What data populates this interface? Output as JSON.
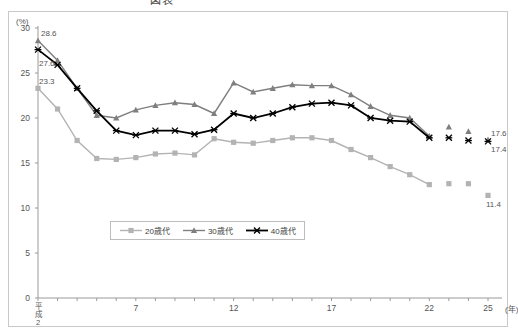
{
  "title": {
    "text": "図表",
    "visible": "partially-cropped"
  },
  "axis": {
    "y_unit": "(%)",
    "x_unit": "(年)",
    "x_era_label": "平成",
    "x_era_value": "2"
  },
  "legend": {
    "items": [
      {
        "label": "20歳代",
        "color": "#b3b3b3",
        "marker": "square"
      },
      {
        "label": "30歳代",
        "color": "#7f7f7f",
        "marker": "triangle"
      },
      {
        "label": "40歳代",
        "color": "#000000",
        "marker": "cross"
      }
    ]
  },
  "annotations": {
    "start": [
      "28.6",
      "27.6",
      "23.3"
    ],
    "end": [
      "17.6",
      "17.4",
      "11.4"
    ]
  },
  "chart_data": {
    "type": "line",
    "xlabel": "(年)",
    "ylabel": "(%)",
    "ylim": [
      0,
      30
    ],
    "yticks": [
      0,
      5,
      10,
      15,
      20,
      25,
      30
    ],
    "xticks_labeled": [
      "平成2",
      "7",
      "12",
      "17",
      "22",
      "25"
    ],
    "x": [
      2,
      3,
      4,
      5,
      6,
      7,
      8,
      9,
      10,
      11,
      12,
      13,
      14,
      15,
      16,
      17,
      18,
      19,
      20,
      21,
      22,
      23,
      24,
      25
    ],
    "grid": false,
    "legend_position": "bottom-center",
    "series": [
      {
        "name": "20歳代",
        "color": "#b3b3b3",
        "marker": "square",
        "values": [
          23.3,
          21.0,
          17.5,
          15.5,
          15.4,
          15.6,
          16.0,
          16.1,
          15.9,
          17.7,
          17.3,
          17.2,
          17.5,
          17.8,
          17.8,
          17.5,
          16.5,
          15.6,
          14.6,
          13.7,
          12.6,
          12.7,
          12.7,
          11.4
        ],
        "gaps": [
          21,
          22
        ]
      },
      {
        "name": "30歳代",
        "color": "#7f7f7f",
        "marker": "triangle",
        "values": [
          28.6,
          26.4,
          23.3,
          20.3,
          20.0,
          20.9,
          21.4,
          21.7,
          21.5,
          20.5,
          23.9,
          22.9,
          23.3,
          23.7,
          23.6,
          23.6,
          22.6,
          21.3,
          20.3,
          20.0,
          18.0,
          19.0,
          18.5,
          17.6
        ],
        "gaps": [
          21,
          22
        ]
      },
      {
        "name": "40歳代",
        "color": "#000000",
        "marker": "cross",
        "values": [
          27.6,
          25.9,
          23.3,
          20.8,
          18.6,
          18.1,
          18.6,
          18.6,
          18.2,
          18.7,
          20.5,
          20.0,
          20.5,
          21.2,
          21.6,
          21.7,
          21.4,
          20.0,
          19.7,
          19.6,
          17.8,
          17.8,
          17.5,
          17.4
        ],
        "gaps": [
          21,
          22
        ]
      }
    ]
  }
}
